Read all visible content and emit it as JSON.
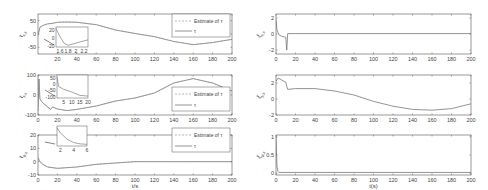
{
  "chart_data": [
    {
      "type": "line",
      "panel": "left-1",
      "ylabel": "τ_{x,s}",
      "xlabel": "",
      "xlim": [
        0,
        200
      ],
      "ylim": [
        -75,
        75
      ],
      "xticks": [
        20,
        40,
        60,
        80,
        100,
        120,
        140,
        160,
        180,
        200
      ],
      "yticks": [
        50,
        0,
        -50
      ],
      "legend": [
        "Estimate of τ_{x,s}",
        "τ_{x,s}"
      ],
      "legend_position": "upper right",
      "series": [
        {
          "name": "τ_{x,s}",
          "x": [
            0,
            2,
            5,
            10,
            15,
            20,
            30,
            40,
            60,
            80,
            100,
            120,
            140,
            160,
            180,
            200
          ],
          "values": [
            -5,
            25,
            32,
            38,
            40,
            44,
            45,
            44,
            35,
            15,
            2,
            -10,
            -28,
            -40,
            -32,
            -20
          ]
        }
      ],
      "inset": {
        "xticks": [
          1.6,
          1.8,
          2,
          2.2
        ],
        "yticks": [
          20,
          0,
          -20
        ],
        "x": [
          1.5,
          1.6,
          1.7,
          1.8,
          2.0,
          2.2,
          2.3
        ],
        "values": [
          30,
          5,
          -15,
          -22,
          -15,
          -8,
          -5
        ]
      }
    },
    {
      "type": "line",
      "panel": "left-2",
      "ylabel": "τ_{y,s}",
      "xlabel": "",
      "xlim": [
        0,
        200
      ],
      "ylim": [
        -100,
        100
      ],
      "xticks": [
        0,
        20,
        40,
        60,
        80,
        100,
        120,
        140,
        160,
        180,
        200
      ],
      "yticks": [
        100,
        0,
        -100
      ],
      "legend": [
        "Estimate of τ_{y,s}",
        "τ_{y,s}"
      ],
      "legend_position": "lower right",
      "series": [
        {
          "name": "τ_{y,s}",
          "x": [
            0,
            1,
            2,
            5,
            10,
            13,
            15,
            20,
            30,
            40,
            60,
            80,
            100,
            120,
            140,
            160,
            180,
            200
          ],
          "values": [
            -80,
            80,
            -20,
            -40,
            -60,
            -72,
            -60,
            -70,
            -78,
            -72,
            -55,
            -30,
            -15,
            10,
            60,
            82,
            60,
            20
          ]
        }
      ],
      "inset": {
        "xticks": [
          5,
          10,
          15,
          20
        ],
        "yticks": [
          50,
          0,
          -50,
          -100
        ],
        "x": [
          1,
          2,
          5,
          10,
          15,
          20
        ],
        "values": [
          60,
          -10,
          -30,
          -50,
          -75,
          -80
        ]
      }
    },
    {
      "type": "line",
      "panel": "left-3",
      "ylabel": "τ_{ψ,s}",
      "xlabel": "t/s",
      "xlim": [
        0,
        200
      ],
      "ylim": [
        -10,
        20
      ],
      "xticks": [
        0,
        20,
        40,
        60,
        80,
        100,
        120,
        140,
        160,
        180,
        200
      ],
      "yticks": [
        20,
        10,
        0,
        -10
      ],
      "legend": [
        "Estimate of τ_{ψ,s}",
        "τ_{ψ,s}"
      ],
      "legend_position": "upper right",
      "series": [
        {
          "name": "τ_{ψ,s}",
          "x": [
            0,
            2,
            5,
            10,
            20,
            40,
            60,
            80,
            100,
            140,
            200
          ],
          "values": [
            3,
            0,
            -2,
            -4,
            -5,
            -4,
            -2,
            -1,
            0,
            0,
            0
          ]
        }
      ],
      "inset": {
        "xticks": [
          2,
          4,
          6
        ],
        "yticks": [],
        "x": [
          1.5,
          2,
          3,
          4,
          5,
          6
        ],
        "values": [
          20,
          14,
          7,
          3,
          1.5,
          1
        ]
      }
    },
    {
      "type": "line",
      "panel": "right-1",
      "ylabel": "ξ_{x,s}",
      "xlabel": "",
      "xlim": [
        0,
        200
      ],
      "ylim": [
        -2.5,
        2.5
      ],
      "xticks": [
        0,
        20,
        40,
        60,
        80,
        100,
        120,
        140,
        160,
        180,
        200
      ],
      "yticks": [
        2,
        0,
        -2
      ],
      "series": [
        {
          "name": "ξ_{x,s}",
          "x": [
            0,
            1,
            3,
            6,
            10,
            11,
            11.5,
            12,
            200
          ],
          "values": [
            1.8,
            0.5,
            -0.1,
            -0.3,
            -0.4,
            -2.0,
            -1.0,
            0.05,
            0.05
          ]
        }
      ]
    },
    {
      "type": "line",
      "panel": "right-2",
      "ylabel": "ξ_{y,s}",
      "xlabel": "",
      "xlim": [
        0,
        200
      ],
      "ylim": [
        -2,
        3
      ],
      "xticks": [
        0,
        20,
        40,
        60,
        80,
        100,
        120,
        140,
        160,
        180,
        200
      ],
      "yticks": [
        2,
        0,
        -2
      ],
      "series": [
        {
          "name": "ξ_{y,s}",
          "x": [
            0,
            2,
            4,
            10,
            11,
            12,
            20,
            40,
            60,
            80,
            100,
            120,
            140,
            160,
            180,
            200
          ],
          "values": [
            2.2,
            2.6,
            2.5,
            2.1,
            1.6,
            1.2,
            1.3,
            1.3,
            1.0,
            0.5,
            -0.3,
            -0.9,
            -1.3,
            -1.4,
            -1.2,
            -0.6
          ]
        }
      ]
    },
    {
      "type": "line",
      "panel": "right-3",
      "ylabel": "ξ_{ψ,s}",
      "xlabel": "t(s)",
      "xlim": [
        0,
        200
      ],
      "ylim": [
        -0.05,
        1.05
      ],
      "xticks": [
        0,
        20,
        40,
        60,
        80,
        100,
        120,
        140,
        160,
        180,
        200
      ],
      "yticks": [
        1,
        0.5,
        0
      ],
      "series": [
        {
          "name": "ξ_{ψ,s}",
          "x": [
            0,
            0.5,
            1,
            2,
            3,
            200
          ],
          "values": [
            1.0,
            0.6,
            0.2,
            0.05,
            0.02,
            0.02
          ]
        }
      ]
    }
  ],
  "labels": {
    "left_xlabel": "t/s",
    "right_xlabel": "t(s)",
    "legend_est": "Estimate of",
    "p1_y": "τ",
    "p1_ysub": "x,s",
    "p2_ysub": "y,s",
    "p3_ysub": "ψ,s",
    "r1_y": "ξ",
    "tau": "τ"
  }
}
